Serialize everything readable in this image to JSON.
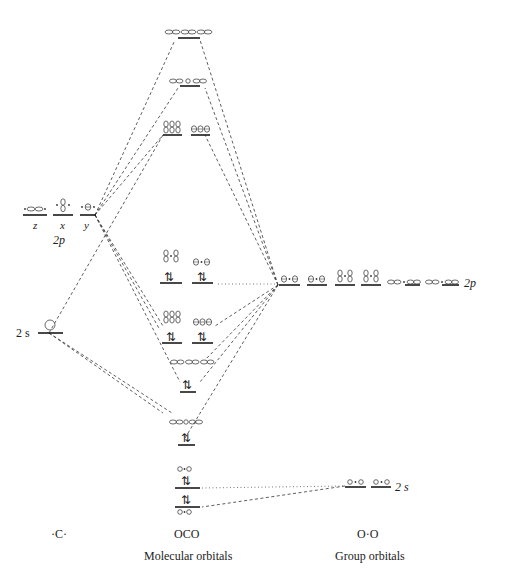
{
  "diagram": {
    "type": "molecular-orbital-diagram",
    "molecule": "CO2",
    "columns": {
      "left": {
        "label": "·C·"
      },
      "center": {
        "label": "OCO",
        "caption": "Molecular orbitals"
      },
      "right": {
        "label": "O·O",
        "caption": "Group orbitals"
      }
    },
    "left_atom": {
      "p_label": "2p",
      "p_components": [
        "z",
        "x",
        "y"
      ],
      "s_label": "2 s"
    },
    "right_group": {
      "p_label": "2p",
      "s_label": "2 s"
    },
    "electron_pair_symbol": "⇅",
    "colors": {
      "line": "#1a1a1a",
      "connector": "#333333",
      "background": "#ffffff"
    }
  }
}
